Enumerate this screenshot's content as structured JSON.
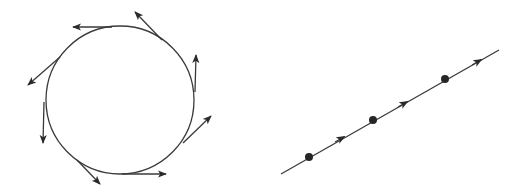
{
  "diagram": {
    "colors": {
      "stroke": "#3a3a3a",
      "fill": "#262626",
      "background": "#ffffff"
    },
    "left_figure": {
      "type": "circle-with-tangent-arrows",
      "circle": {
        "cx": 120,
        "cy": 100,
        "r": 74
      },
      "tangent_arrows": [
        {
          "x1": 112,
          "y1": 27,
          "x2": 73,
          "y2": 27
        },
        {
          "x1": 162,
          "y1": 40,
          "x2": 135,
          "y2": 12
        },
        {
          "x1": 195,
          "y1": 92,
          "x2": 196,
          "y2": 55
        },
        {
          "x1": 183,
          "y1": 143,
          "x2": 211,
          "y2": 116
        },
        {
          "x1": 122,
          "y1": 174,
          "x2": 166,
          "y2": 174
        },
        {
          "x1": 77,
          "y1": 160,
          "x2": 100,
          "y2": 184
        },
        {
          "x1": 44,
          "y1": 102,
          "x2": 43,
          "y2": 143
        },
        {
          "x1": 60,
          "y1": 57,
          "x2": 28,
          "y2": 85
        }
      ]
    },
    "right_figure": {
      "type": "line-with-points-and-arrows",
      "line": {
        "x1": 281,
        "y1": 174,
        "x2": 499,
        "y2": 50
      },
      "points": [
        {
          "cx": 309,
          "cy": 157
        },
        {
          "cx": 373,
          "cy": 120
        },
        {
          "cx": 445,
          "cy": 79
        }
      ],
      "arrows": [
        {
          "x": 342,
          "y": 138
        },
        {
          "x": 405,
          "y": 103
        },
        {
          "x": 479,
          "y": 61
        }
      ]
    }
  }
}
